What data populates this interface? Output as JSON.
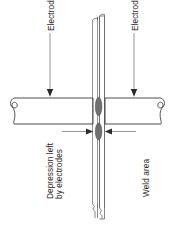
{
  "figure": {
    "background_color": "#ffffff",
    "line_color": "#3a3a3a",
    "nugget_color": "#6f6f6f",
    "text_color": "#242424"
  },
  "labels": {
    "electrode_left": "Electrode",
    "electrode_right": "Electrode",
    "depression_line1": "Depression left",
    "depression_line2": "by electrodes",
    "weld_area": "Weld area"
  },
  "parts": {
    "electrode_left_name": "left-electrode-body",
    "electrode_right_name": "right-electrode-body",
    "sheet_front_name": "front-workpiece-sheet",
    "sheet_back_name": "back-workpiece-sheet",
    "nugget_upper_name": "upper-weld-nugget",
    "nugget_lower_name": "lower-weld-nugget"
  }
}
